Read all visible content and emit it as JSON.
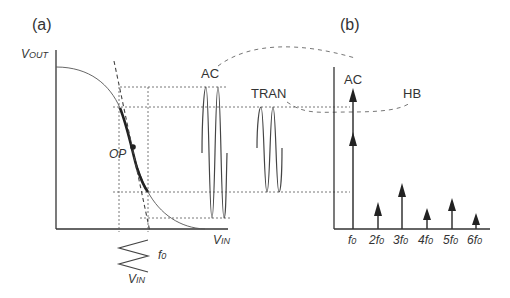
{
  "panel_a": {
    "label": "(a)",
    "y_axis_label": "VOUT",
    "y_axis_label_main": "V",
    "y_axis_label_sub": "OUT",
    "x_axis_label_main": "V",
    "x_axis_label_sub": "IN",
    "operating_point_label": "OP",
    "input_label_main": "V",
    "input_label_sub": "IN",
    "input_freq_label_main": "f",
    "input_freq_label_sub": "0",
    "ac_label": "AC",
    "tran_label": "TRAN"
  },
  "panel_b": {
    "label": "(b)",
    "ac_label": "AC",
    "hb_label": "HB",
    "harmonics": [
      {
        "label_prefix": "",
        "label_main": "f",
        "label_sub": "0",
        "height": 1.0
      },
      {
        "label_prefix": "2",
        "label_main": "f",
        "label_sub": "0",
        "height": 0.18
      },
      {
        "label_prefix": "3",
        "label_main": "f",
        "label_sub": "0",
        "height": 0.38
      },
      {
        "label_prefix": "4",
        "label_main": "f",
        "label_sub": "0",
        "height": 0.14
      },
      {
        "label_prefix": "5",
        "label_main": "f",
        "label_sub": "0",
        "height": 0.24
      },
      {
        "label_prefix": "6",
        "label_main": "f",
        "label_sub": "0",
        "height": 0.1
      }
    ]
  },
  "colors": {
    "line": "#333333",
    "background": "#ffffff"
  }
}
